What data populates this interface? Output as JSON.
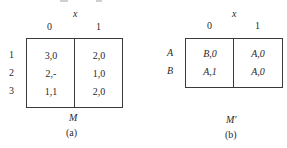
{
  "figure_a": {
    "input_var": "x",
    "columns": [
      "0",
      "1"
    ],
    "rows": [
      {
        "state": "1",
        "cells": [
          "3,0",
          "2,0"
        ]
      },
      {
        "state": "2",
        "cells": [
          "2,-",
          "1,0"
        ]
      },
      {
        "state": "3",
        "cells": [
          "1,1",
          "2,0"
        ]
      }
    ],
    "machine_label": "M",
    "caption": "(a)"
  },
  "figure_b": {
    "input_var": "x",
    "columns": [
      "0",
      "1"
    ],
    "rows": [
      {
        "state": "A",
        "cells": [
          "B,0",
          "A,0"
        ]
      },
      {
        "state": "B",
        "cells": [
          "A,1",
          "A,0"
        ]
      }
    ],
    "machine_label": "M′",
    "caption": "(b)"
  }
}
